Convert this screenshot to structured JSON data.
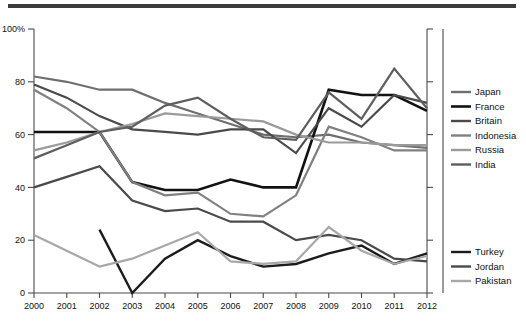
{
  "chart_data": {
    "type": "line",
    "title": "",
    "xlabel": "",
    "ylabel": "",
    "grid": false,
    "legend_position": "right",
    "x": [
      2000,
      2001,
      2002,
      2003,
      2004,
      2005,
      2006,
      2007,
      2008,
      2009,
      2010,
      2011,
      2012
    ],
    "categories": [
      "2000",
      "2001",
      "2002",
      "2003",
      "2004",
      "2005",
      "2006",
      "2007",
      "2008",
      "2009",
      "2010",
      "2011",
      "2012"
    ],
    "ylim": [
      0,
      100
    ],
    "yticks": [
      0,
      20,
      40,
      60,
      80,
      100
    ],
    "ytick_labels": [
      "0",
      "20",
      "40",
      "60",
      "80",
      "100%"
    ],
    "series": [
      {
        "name": "Japan",
        "color": "#6e6e6e",
        "width": 2.2,
        "values": [
          82,
          80,
          77,
          77,
          72,
          68,
          64,
          60,
          59,
          60,
          57,
          56,
          55
        ]
      },
      {
        "name": "France",
        "color": "#121212",
        "width": 2.6,
        "values": [
          61,
          61,
          61,
          42,
          39,
          39,
          43,
          40,
          40,
          77,
          75,
          75,
          69
        ]
      },
      {
        "name": "Britain",
        "color": "#4a4a4a",
        "width": 2.2,
        "values": [
          79,
          74,
          67,
          62,
          61,
          60,
          62,
          62,
          53,
          70,
          63,
          75,
          72
        ]
      },
      {
        "name": "Indonesia",
        "color": "#808080",
        "width": 2.2,
        "values": [
          77,
          70,
          61,
          42,
          37,
          38,
          30,
          29,
          37,
          63,
          59,
          54,
          54
        ]
      },
      {
        "name": "Russia",
        "color": "#9a9a9a",
        "width": 2.2,
        "values": [
          54,
          57,
          61,
          64,
          68,
          67,
          66,
          65,
          60,
          57,
          57,
          56,
          56
        ]
      },
      {
        "name": "India",
        "color": "#5e5e5e",
        "width": 2.2,
        "values": [
          51,
          56,
          61,
          63,
          71,
          74,
          66,
          59,
          58,
          76,
          66,
          85,
          70
        ]
      },
      {
        "name": "Turkey",
        "color": "#1c1c1c",
        "width": 2.4,
        "values": [
          null,
          null,
          24,
          0,
          13,
          20,
          14,
          10,
          11,
          15,
          18,
          11,
          15
        ]
      },
      {
        "name": "Jordan",
        "color": "#4a4a4a",
        "width": 2.2,
        "values": [
          40,
          44,
          48,
          35,
          31,
          32,
          27,
          27,
          20,
          22,
          20,
          13,
          12
        ]
      },
      {
        "name": "Pakistan",
        "color": "#a8a8a8",
        "width": 2.2,
        "values": [
          22,
          16,
          10,
          13,
          18,
          23,
          12,
          11,
          12,
          25,
          16,
          11,
          14
        ]
      }
    ]
  },
  "legend_groups": [
    {
      "id": "group-top",
      "items": [
        "Japan",
        "France",
        "Britain",
        "Indonesia",
        "Russia",
        "India"
      ]
    },
    {
      "id": "group-bottom",
      "items": [
        "Turkey",
        "Jordan",
        "Pakistan"
      ]
    }
  ]
}
